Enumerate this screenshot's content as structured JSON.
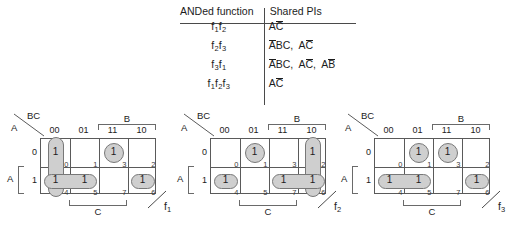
{
  "table": {
    "headers": {
      "left": "ANDed function",
      "right": "Shared PIs"
    },
    "rows": [
      {
        "function": "f1f2",
        "pis": "AC̄"
      },
      {
        "function": "f2f3",
        "pis": "ĀBC, AC̄"
      },
      {
        "function": "f3f1",
        "pis": "ĀBC, AC̄, AB̄"
      },
      {
        "function": "f1f2f3",
        "pis": "AC̄"
      }
    ],
    "function_parts": [
      [
        [
          "f",
          "1"
        ],
        [
          "f",
          "2"
        ]
      ],
      [
        [
          "f",
          "2"
        ],
        [
          "f",
          "3"
        ]
      ],
      [
        [
          "f",
          "3"
        ],
        [
          "f",
          "1"
        ]
      ],
      [
        [
          "f",
          "1"
        ],
        [
          "f",
          "2"
        ],
        [
          "f",
          "3"
        ]
      ]
    ],
    "pi_parts": [
      [
        [
          {
            "t": "A",
            "bar": false
          },
          {
            "t": "C",
            "bar": true
          }
        ]
      ],
      [
        [
          {
            "t": "A",
            "bar": true
          },
          {
            "t": "B",
            "bar": false
          },
          {
            "t": "C",
            "bar": false
          }
        ],
        [
          {
            "t": "A",
            "bar": false
          },
          {
            "t": "C",
            "bar": true
          }
        ]
      ],
      [
        [
          {
            "t": "A",
            "bar": true
          },
          {
            "t": "B",
            "bar": false
          },
          {
            "t": "C",
            "bar": false
          }
        ],
        [
          {
            "t": "A",
            "bar": false
          },
          {
            "t": "C",
            "bar": true
          }
        ],
        [
          {
            "t": "A",
            "bar": false
          },
          {
            "t": "B",
            "bar": true
          }
        ]
      ],
      [
        [
          {
            "t": "A",
            "bar": false
          },
          {
            "t": "C",
            "bar": true
          }
        ]
      ]
    ]
  },
  "kmap_common": {
    "corner_top_label": "BC",
    "corner_side_label": "A",
    "column_headers": [
      "00",
      "01",
      "11",
      "10"
    ],
    "row_headers": [
      "0",
      "1"
    ],
    "bracket_b": "B",
    "bracket_c": "C",
    "bracket_a": "A",
    "cell_indices_top": [
      "0",
      "1",
      "3",
      "2"
    ],
    "cell_indices_bottom": [
      "4",
      "5",
      "7",
      "6"
    ],
    "one_label": "1"
  },
  "kmaps": [
    {
      "name": "f1",
      "label_base": "f",
      "label_sub": "1",
      "minterms_top": [
        1,
        0,
        1,
        0
      ],
      "minterms_bottom": [
        1,
        1,
        0,
        1
      ],
      "groups": [
        {
          "shape": "pillv",
          "col": 0,
          "row": 0,
          "span_rows": 2,
          "style": "pale"
        },
        {
          "shape": "circ",
          "col": 2,
          "row": 0,
          "style": "pale"
        },
        {
          "shape": "pill",
          "col": 0,
          "row": 1,
          "span_cols": 2,
          "style": "pale"
        },
        {
          "shape": "pill",
          "col": 3,
          "row": 1,
          "style": "pale"
        }
      ]
    },
    {
      "name": "f2",
      "label_base": "f",
      "label_sub": "2",
      "minterms_top": [
        0,
        1,
        0,
        1
      ],
      "minterms_bottom": [
        1,
        0,
        1,
        1
      ],
      "groups": [
        {
          "shape": "circ",
          "col": 1,
          "row": 0,
          "style": "pale"
        },
        {
          "shape": "pillv",
          "col": 3,
          "row": 0,
          "span_rows": 2,
          "style": "pale"
        },
        {
          "shape": "pill",
          "col": 0,
          "row": 1,
          "style": "pale"
        },
        {
          "shape": "pill",
          "col": 2,
          "row": 1,
          "span_cols": 2,
          "style": "pale"
        }
      ]
    },
    {
      "name": "f3",
      "label_base": "f",
      "label_sub": "3",
      "minterms_top": [
        0,
        1,
        1,
        0
      ],
      "minterms_bottom": [
        1,
        1,
        0,
        1
      ],
      "groups": [
        {
          "shape": "circ",
          "col": 1,
          "row": 0,
          "style": "pale"
        },
        {
          "shape": "circ",
          "col": 2,
          "row": 0,
          "style": "pale"
        },
        {
          "shape": "pill",
          "col": 0,
          "row": 1,
          "span_cols": 2,
          "style": "pale"
        },
        {
          "shape": "pill",
          "col": 3,
          "row": 1,
          "style": "pale"
        }
      ]
    }
  ]
}
